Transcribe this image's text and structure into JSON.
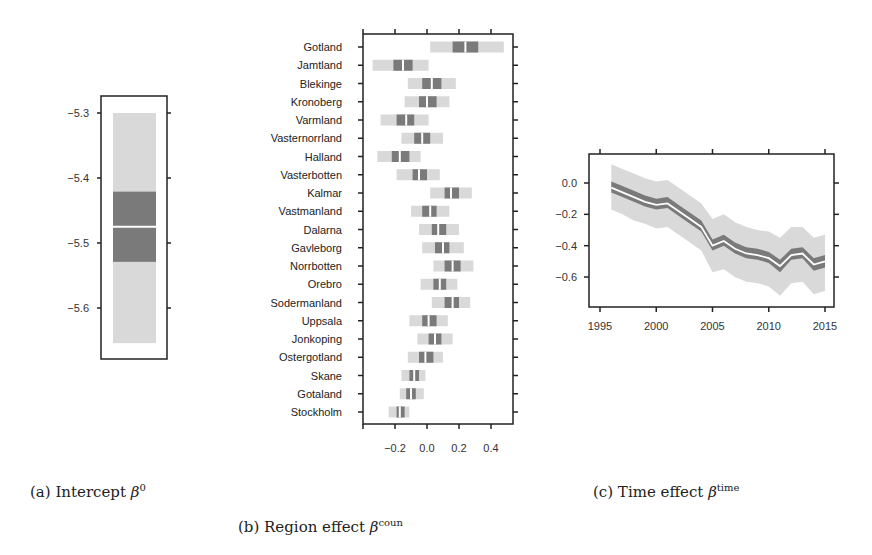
{
  "captions": {
    "a": {
      "prefix": "(a) Intercept ",
      "symbol": "β",
      "sup": "0"
    },
    "b": {
      "prefix": "(b) Region effect ",
      "symbol": "β",
      "sup": "coun"
    },
    "c": {
      "prefix": "(c) Time effect ",
      "symbol": "β",
      "sup": "time"
    }
  },
  "colors": {
    "outer_band": "#d9d9d9",
    "inner_band": "#7a7a7a",
    "median": "#ffffff",
    "axis": "#222222"
  },
  "chart_data": [
    {
      "id": "a",
      "type": "interval",
      "title": "(a) Intercept β^0",
      "xlabel": "",
      "ylabel": "",
      "yticks": [
        -5.3,
        -5.4,
        -5.5,
        -5.6
      ],
      "ylim": [
        -5.675,
        -5.275
      ],
      "median": -5.475,
      "inner": [
        -5.529,
        -5.421
      ],
      "outer": [
        -5.654,
        -5.3
      ]
    },
    {
      "id": "b",
      "type": "interval",
      "title": "(b) Region effect β^coun",
      "orientation": "horizontal",
      "xticks": [
        -0.2,
        0.0,
        0.2,
        0.4
      ],
      "xtick_labels": [
        "−0.2",
        "0.0",
        "0.2",
        "0.4"
      ],
      "xlim": [
        -0.4,
        0.54
      ],
      "categories": [
        "Gotland",
        "Jamtland",
        "Blekinge",
        "Kronoberg",
        "Varmland",
        "Vasternorrland",
        "Halland",
        "Vasterbotten",
        "Kalmar",
        "Vastmanland",
        "Dalarna",
        "Gavleborg",
        "Norrbotten",
        "Orebro",
        "Sodermanland",
        "Uppsala",
        "Jonkoping",
        "Ostergotland",
        "Skane",
        "Gotaland",
        "Stockholm"
      ],
      "median": [
        0.24,
        -0.15,
        0.03,
        0.0,
        -0.13,
        -0.03,
        -0.17,
        -0.05,
        0.15,
        0.02,
        0.07,
        0.1,
        0.16,
        0.08,
        0.16,
        0.01,
        0.05,
        -0.01,
        -0.08,
        -0.1,
        -0.17
      ],
      "inner_low": [
        0.16,
        -0.21,
        -0.03,
        -0.05,
        -0.19,
        -0.08,
        -0.22,
        -0.09,
        0.11,
        -0.03,
        0.03,
        0.05,
        0.11,
        0.04,
        0.11,
        -0.03,
        0.01,
        -0.05,
        -0.11,
        -0.13,
        -0.19
      ],
      "inner_high": [
        0.32,
        -0.09,
        0.09,
        0.06,
        -0.08,
        0.02,
        -0.11,
        0.0,
        0.2,
        0.06,
        0.12,
        0.14,
        0.21,
        0.12,
        0.2,
        0.06,
        0.09,
        0.04,
        -0.05,
        -0.07,
        -0.14
      ],
      "outer_low": [
        0.02,
        -0.34,
        -0.12,
        -0.14,
        -0.29,
        -0.16,
        -0.31,
        -0.19,
        0.02,
        -0.1,
        -0.05,
        -0.03,
        0.04,
        -0.04,
        0.03,
        -0.11,
        -0.06,
        -0.12,
        -0.16,
        -0.17,
        -0.24
      ],
      "outer_high": [
        0.48,
        0.01,
        0.18,
        0.14,
        0.01,
        0.1,
        -0.04,
        0.08,
        0.28,
        0.14,
        0.2,
        0.23,
        0.29,
        0.19,
        0.27,
        0.13,
        0.16,
        0.1,
        -0.01,
        -0.02,
        -0.11
      ]
    },
    {
      "id": "c",
      "type": "line",
      "title": "(c) Time effect β^time",
      "xticks": [
        1995,
        2000,
        2005,
        2010,
        2015
      ],
      "yticks": [
        0.0,
        -0.2,
        -0.4,
        -0.6
      ],
      "ytick_labels": [
        "0.0",
        "−0.2",
        "−0.4",
        "−0.6"
      ],
      "xlim": [
        1994.1,
        2015.9
      ],
      "ylim": [
        -0.79,
        0.19
      ],
      "x": [
        1996,
        1997,
        1998,
        1999,
        2000,
        2001,
        2002,
        2003,
        2004,
        2005,
        2006,
        2007,
        2008,
        2009,
        2010,
        2011,
        2012,
        2013,
        2014,
        2015
      ],
      "median": [
        -0.03,
        -0.06,
        -0.09,
        -0.12,
        -0.14,
        -0.13,
        -0.18,
        -0.23,
        -0.28,
        -0.4,
        -0.37,
        -0.42,
        -0.45,
        -0.46,
        -0.48,
        -0.53,
        -0.46,
        -0.45,
        -0.52,
        -0.5
      ],
      "inner_low": [
        -0.06,
        -0.09,
        -0.12,
        -0.15,
        -0.17,
        -0.16,
        -0.21,
        -0.26,
        -0.31,
        -0.43,
        -0.4,
        -0.45,
        -0.48,
        -0.49,
        -0.51,
        -0.57,
        -0.49,
        -0.48,
        -0.56,
        -0.54
      ],
      "inner_high": [
        0.01,
        -0.02,
        -0.05,
        -0.08,
        -0.1,
        -0.09,
        -0.14,
        -0.19,
        -0.24,
        -0.36,
        -0.33,
        -0.38,
        -0.41,
        -0.42,
        -0.44,
        -0.49,
        -0.42,
        -0.41,
        -0.48,
        -0.46
      ],
      "outer_low": [
        -0.17,
        -0.2,
        -0.24,
        -0.26,
        -0.29,
        -0.28,
        -0.33,
        -0.38,
        -0.43,
        -0.57,
        -0.55,
        -0.6,
        -0.63,
        -0.64,
        -0.66,
        -0.72,
        -0.64,
        -0.63,
        -0.71,
        -0.69
      ],
      "outer_high": [
        0.12,
        0.09,
        0.06,
        0.03,
        0.01,
        0.02,
        -0.03,
        -0.08,
        -0.13,
        -0.23,
        -0.2,
        -0.25,
        -0.28,
        -0.3,
        -0.31,
        -0.35,
        -0.28,
        -0.28,
        -0.35,
        -0.33
      ]
    }
  ]
}
